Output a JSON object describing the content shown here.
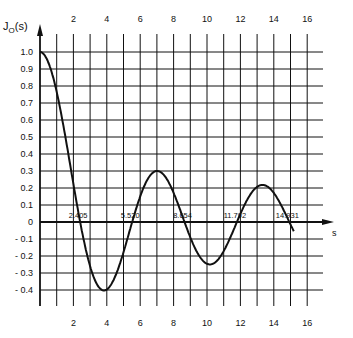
{
  "chart_data": {
    "type": "line",
    "title": "",
    "xlabel": "s",
    "ylabel": "J0(s)",
    "ylabel_main": "J",
    "ylabel_sub": "O",
    "ylabel_arg": "(s)",
    "xlim": [
      0,
      16
    ],
    "ylim": [
      -0.4,
      1.0
    ],
    "grid": true,
    "x_ticks": [
      2,
      4,
      6,
      8,
      10,
      12,
      14,
      16
    ],
    "x_tick_labels": [
      "2",
      "4",
      "6",
      "8",
      "10",
      "12",
      "14",
      "16"
    ],
    "y_ticks": [
      1.0,
      0.9,
      0.8,
      0.7,
      0.6,
      0.5,
      0.4,
      0.3,
      0.2,
      0.1,
      0,
      -0.1,
      -0.2,
      -0.3,
      -0.4
    ],
    "y_tick_labels": [
      "1.0",
      "0.9",
      "0.8",
      "0.7",
      "0.6",
      "0.5",
      "0.4",
      "0.3",
      "0.2",
      "0.1",
      "0",
      "- 0.1",
      "- 0.2",
      "- 0.3",
      "- 0.4"
    ],
    "series": [
      {
        "name": "J0(s)",
        "function": "Bessel function of the first kind, order 0",
        "x": [
          0,
          1,
          2,
          2.405,
          3,
          3.832,
          4,
          5,
          5.52,
          6,
          7,
          7.016,
          8,
          8.654,
          9,
          10,
          10.173,
          11,
          11.792,
          12,
          13,
          13.324,
          14,
          14.931,
          15.2
        ],
        "values": [
          1.0,
          0.765,
          0.224,
          0.0,
          -0.26,
          -0.403,
          -0.397,
          -0.178,
          0.0,
          0.151,
          0.3,
          0.3,
          0.172,
          0.0,
          -0.09,
          -0.246,
          -0.25,
          -0.171,
          0.0,
          0.048,
          0.207,
          0.218,
          0.171,
          0.0,
          -0.09
        ]
      }
    ],
    "annotations": [
      {
        "text": "2.405",
        "x": 2.405,
        "y": 0
      },
      {
        "text": "5.520",
        "x": 5.52,
        "y": 0
      },
      {
        "text": "8.654",
        "x": 8.654,
        "y": 0
      },
      {
        "text": "11.792",
        "x": 11.792,
        "y": 0
      },
      {
        "text": "14.931",
        "x": 14.931,
        "y": 0
      }
    ]
  }
}
